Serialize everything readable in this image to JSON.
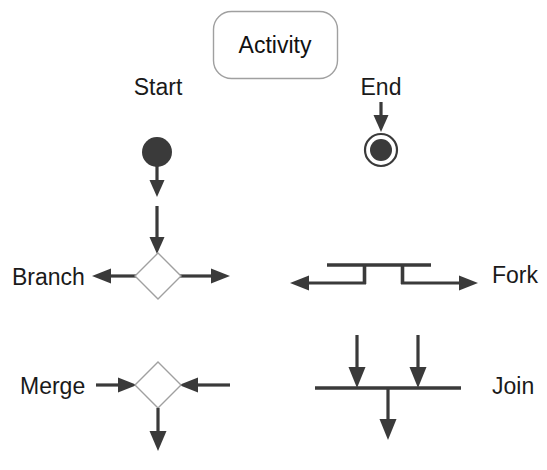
{
  "diagram": {
    "background_color": "#ffffff",
    "ink_color": "#3a3a3a",
    "outline_color": "#a0a0a0",
    "text_color": "#1a1a1a"
  },
  "labels": {
    "activity": "Activity",
    "start": "Start",
    "end": "End",
    "branch": "Branch",
    "fork": "Fork",
    "merge": "Merge",
    "join": "Join"
  },
  "nodes": [
    {
      "id": "activity",
      "label": "Activity",
      "shape": "rounded-rectangle",
      "x": 213,
      "y": 11,
      "width": 124,
      "height": 67,
      "corner_radius": 18,
      "fill": "#ffffff",
      "stroke": "#a0a0a0"
    },
    {
      "id": "start",
      "label": "Start",
      "shape": "filled-circle",
      "cx": 157,
      "cy": 152,
      "r": 15,
      "fill": "#3a3a3a",
      "label_x": 158,
      "label_y": 95
    },
    {
      "id": "end",
      "label": "End",
      "shape": "circle-in-ring",
      "cx": 381,
      "cy": 150,
      "outer_r": 17,
      "inner_r": 11,
      "fill": "#3a3a3a",
      "label_x": 381,
      "label_y": 95
    },
    {
      "id": "branch",
      "label": "Branch",
      "shape": "diamond",
      "cx": 158,
      "cy": 276,
      "half_width": 23,
      "half_height": 23,
      "fill": "#ffffff",
      "stroke": "#a0a0a0",
      "label_x": 12,
      "label_y": 285,
      "label_anchor": "start"
    },
    {
      "id": "fork",
      "label": "Fork",
      "shape": "fork-bar",
      "label_x": 492,
      "label_y": 283,
      "label_anchor": "start"
    },
    {
      "id": "merge",
      "label": "Merge",
      "shape": "diamond",
      "cx": 158,
      "cy": 385,
      "half_width": 23,
      "half_height": 23,
      "fill": "#ffffff",
      "stroke": "#a0a0a0",
      "label_x": 20,
      "label_y": 394,
      "label_anchor": "start"
    },
    {
      "id": "join",
      "label": "Join",
      "shape": "join-bar",
      "label_x": 492,
      "label_y": 394,
      "label_anchor": "start"
    }
  ],
  "connectors": [
    {
      "id": "start-to-mid",
      "from": "start",
      "direction": "down",
      "x": 157,
      "y1": 167,
      "y2": 196
    },
    {
      "id": "mid-to-branch",
      "from": "flow",
      "to": "branch",
      "direction": "down",
      "x": 157,
      "y1": 206,
      "y2": 253
    },
    {
      "id": "end-inbound",
      "to": "end",
      "direction": "down",
      "x": 381,
      "y1": 104,
      "y2": 131
    },
    {
      "id": "branch-left",
      "from": "branch",
      "direction": "left",
      "y": 276,
      "x1": 136,
      "x2": 93
    },
    {
      "id": "branch-right",
      "from": "branch",
      "direction": "right",
      "y": 276,
      "x1": 180,
      "x2": 229
    },
    {
      "id": "fork-left",
      "from": "fork",
      "direction": "left",
      "y": 283,
      "x1": 365,
      "x2": 291
    },
    {
      "id": "fork-right",
      "from": "fork",
      "direction": "right",
      "y": 283,
      "x1": 401,
      "x2": 477
    },
    {
      "id": "merge-left",
      "to": "merge",
      "direction": "right",
      "y": 385,
      "x1": 90,
      "x2": 135
    },
    {
      "id": "merge-right",
      "to": "merge",
      "direction": "left",
      "y": 385,
      "x1": 229,
      "x2": 181
    },
    {
      "id": "merge-out",
      "from": "merge",
      "direction": "down",
      "x": 158,
      "y1": 408,
      "y2": 450
    },
    {
      "id": "join-in-1",
      "to": "join",
      "direction": "down",
      "x": 357,
      "y1": 336,
      "y2": 387
    },
    {
      "id": "join-in-2",
      "to": "join",
      "direction": "down",
      "x": 418,
      "y1": 336,
      "y2": 387
    },
    {
      "id": "join-out",
      "from": "join",
      "direction": "down",
      "x": 388,
      "y1": 390,
      "y2": 440
    }
  ],
  "bars": {
    "fork_top": {
      "x1": 327,
      "x2": 431,
      "y": 265
    },
    "fork_drop_left": {
      "x": 364,
      "y1": 265,
      "y2": 283
    },
    "fork_drop_right": {
      "x": 402,
      "y1": 265,
      "y2": 283
    },
    "join_bar": {
      "x1": 315,
      "x2": 461,
      "y": 388
    }
  }
}
